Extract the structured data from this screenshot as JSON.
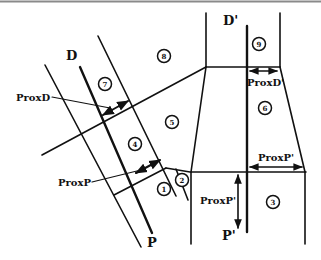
{
  "diagram": {
    "labels": {
      "D": "D",
      "D_prime": "D'",
      "P": "P",
      "P_prime": "P'",
      "ProxD": "ProxD",
      "ProxD_prime": "ProxD'",
      "ProxP": "ProxP",
      "ProxP_prime_horizontal": "ProxP'",
      "ProxP_prime_vertical": "ProxP'"
    },
    "regions": [
      "1",
      "2",
      "3",
      "4",
      "5",
      "6",
      "7",
      "8",
      "9"
    ],
    "colors": {
      "line": "#111111",
      "background": "#ffffff",
      "top_border": "#888888"
    }
  }
}
